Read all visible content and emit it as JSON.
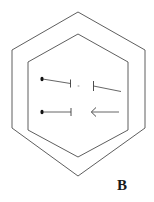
{
  "figure": {
    "panel_label": "B",
    "panel_label_position": {
      "x": 117,
      "y": 178
    },
    "canvas": {
      "width": 154,
      "height": 202
    },
    "background_color": "#ffffff",
    "line_color": "#4c4c4c",
    "arrow_color": "#555555",
    "label_color": "#1a1a1a",
    "center_dot_color": "#c8c8c8"
  },
  "shapes": {
    "outer_hexagon": {
      "name": "outer-hexagon",
      "points": "78,12 145,50 145,128 78,176 12,128 12,50",
      "stroke": "#4c4c4c",
      "stroke_width": 0.9
    },
    "inner_hexagon": {
      "name": "inner-hexagon",
      "points": "78,34 128,62 128,130 78,157 28,130 28,62",
      "stroke": "#4c4c4c",
      "stroke_width": 0.9
    },
    "center_marker": {
      "name": "center-dot",
      "cx": 78.5,
      "cy": 86,
      "r": 1.1
    }
  },
  "arrows": [
    {
      "id": "arrow-top-left",
      "label": "top-left-inward-arrow",
      "direction": "rightward",
      "shaft": {
        "x1": 42.5,
        "y1": 79.0,
        "x2": 70.5,
        "y2": 83.5
      },
      "tail_dot": {
        "cx": 42.0,
        "cy": 79.0,
        "rx": 1.6,
        "ry": 2.2
      },
      "head_bar": {
        "x1": 70.5,
        "y1": 79.5,
        "x2": 70.5,
        "y2": 87.5
      }
    },
    {
      "id": "arrow-top-right",
      "label": "top-right-inward-arrow",
      "direction": "leftward",
      "shaft": {
        "x1": 93.5,
        "y1": 86.0,
        "x2": 121.0,
        "y2": 91.5
      },
      "tail_dot": null,
      "head_bar": {
        "x1": 93.5,
        "y1": 81.0,
        "x2": 93.5,
        "y2": 91.0
      }
    },
    {
      "id": "arrow-bottom-left",
      "label": "bottom-left-inward-arrow",
      "direction": "rightward",
      "shaft": {
        "x1": 42.5,
        "y1": 112.0,
        "x2": 71.0,
        "y2": 112.0
      },
      "tail_dot": {
        "cx": 42.0,
        "cy": 112.0,
        "rx": 1.6,
        "ry": 2.2
      },
      "head_bar": {
        "x1": 71.0,
        "y1": 108.0,
        "x2": 71.0,
        "y2": 116.0
      }
    },
    {
      "id": "arrow-bottom-right",
      "label": "bottom-right-inward-arrow",
      "direction": "leftward",
      "shaft": {
        "x1": 91.5,
        "y1": 112.0,
        "x2": 119.0,
        "y2": 112.0
      },
      "tail_dot": null,
      "head_chevron": "M 96.0 107.5 L 91.3 112.0 L 96.0 116.5"
    }
  ]
}
